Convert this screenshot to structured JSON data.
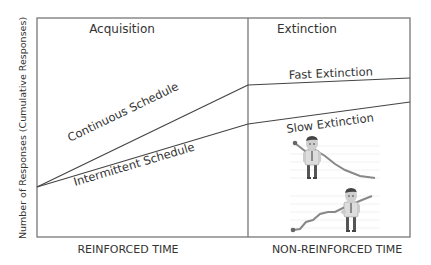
{
  "diagram": {
    "y_axis_label": "Number of Responses (Cumulative Responses)",
    "sections": [
      {
        "title": "Acquisition",
        "x_label": "REINFORCED TIME"
      },
      {
        "title": "Extinction",
        "x_label": "NON-REINFORCED TIME"
      }
    ],
    "curves": [
      {
        "label": "Continuous Schedule",
        "phase": "acquisition"
      },
      {
        "label": "Intermittent Schedule",
        "phase": "acquisition"
      },
      {
        "label": "Fast Extinction",
        "phase": "extinction"
      },
      {
        "label": "Slow Extinction",
        "phase": "extinction"
      }
    ],
    "illustrations": [
      {
        "name": "businessman-declining-chart",
        "description": "man with descending line graph"
      },
      {
        "name": "businessman-rising-chart",
        "description": "man with ascending line graph"
      }
    ],
    "colors": {
      "line": "#444444",
      "frame": "#777777",
      "text": "#333333"
    }
  }
}
